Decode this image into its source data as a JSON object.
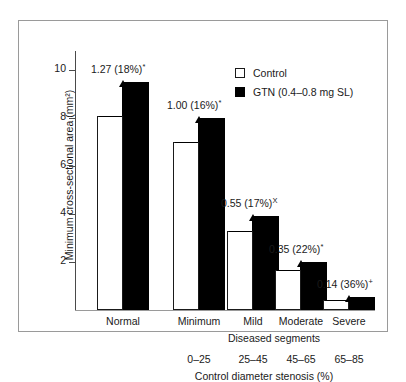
{
  "chart_data": {
    "type": "bar",
    "title": "",
    "xlabel": "Control diameter stenosis (%)",
    "ylabel": "Minimum cross-sectional area (mm²)",
    "ylim": [
      0,
      10.8
    ],
    "yticks": [
      2,
      4,
      6,
      8,
      10
    ],
    "ytick_labels": [
      "2",
      "4",
      "6",
      "8",
      "10"
    ],
    "grid": false,
    "legend_position": "top-right",
    "categories": [
      "Normal",
      "Minimum",
      "Mild",
      "Moderate",
      "Severe"
    ],
    "group_label": "Diseased segments",
    "stenosis_ranges": [
      "0–25",
      "25–45",
      "45–65",
      "65–85"
    ],
    "series": [
      {
        "name": "Control",
        "color": "#ffffff",
        "values": [
          8.1,
          7.0,
          3.3,
          1.65,
          0.4
        ]
      },
      {
        "name": "GTN (0.4–0.8 mg SL)",
        "color": "#000000",
        "values": [
          9.5,
          8.0,
          3.9,
          2.0,
          0.55
        ]
      }
    ],
    "annotations": [
      {
        "category": "Normal",
        "delta": "1.27",
        "percent": "(18%)",
        "marker": "*"
      },
      {
        "category": "Minimum",
        "delta": "1.00",
        "percent": "(16%)",
        "marker": "*"
      },
      {
        "category": "Mild",
        "delta": "0.55",
        "percent": "(17%)",
        "marker": "X"
      },
      {
        "category": "Moderate",
        "delta": "0.35",
        "percent": "(22%)",
        "marker": "*"
      },
      {
        "category": "Severe",
        "delta": "0.14",
        "percent": "(36%)",
        "marker": "+"
      }
    ]
  },
  "legend": {
    "items": [
      {
        "label": "Control"
      },
      {
        "label": "GTN (0.4–0.8 mg SL)"
      }
    ]
  },
  "axes": {
    "y_title": "Minimum cross-sectional area (mm²)",
    "x_title": "Control diameter stenosis (%)",
    "group_title": "Diseased segments"
  }
}
